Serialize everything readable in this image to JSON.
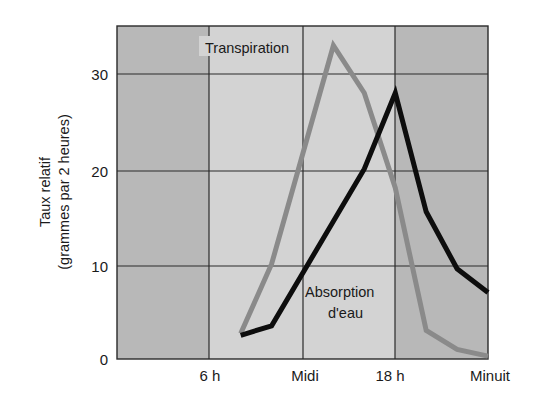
{
  "chart_data": {
    "type": "line",
    "title": "",
    "xlabel": "",
    "ylabel": [
      "Taux relatif",
      "(grammes par 2 heures)"
    ],
    "x_ticks": [
      {
        "label": "6 h",
        "hour": 6
      },
      {
        "label": "Midi",
        "hour": 12
      },
      {
        "label": "18 h",
        "hour": 18
      },
      {
        "label": "Minuit",
        "hour": 24
      }
    ],
    "y_ticks": [
      0,
      10,
      20,
      30
    ],
    "xlim": [
      0,
      24
    ],
    "ylim": [
      0,
      35
    ],
    "grid": true,
    "series": [
      {
        "name": "Transpiration",
        "color": "#8a8a8a",
        "x": [
          8,
          10,
          14,
          16,
          18,
          20,
          22,
          24
        ],
        "values": [
          2.7,
          10,
          33,
          28,
          18,
          3,
          1,
          0.3
        ]
      },
      {
        "name": "Absorption d'eau",
        "color": "#0d0d0d",
        "x": [
          8,
          10,
          16,
          18,
          20,
          22,
          24
        ],
        "values": [
          2.5,
          3.5,
          20,
          28,
          15.5,
          9.5,
          7
        ]
      }
    ],
    "annotations": [
      {
        "text": "Transpiration",
        "near": "transpiration-peak"
      },
      {
        "text": "Absorption d'eau",
        "near": "absorption-mid"
      }
    ],
    "background_bands": [
      {
        "from": 0,
        "to": 6,
        "shade": "dark"
      },
      {
        "from": 6,
        "to": 18,
        "shade": "light"
      },
      {
        "from": 18,
        "to": 24,
        "shade": "dark"
      }
    ]
  },
  "labels": {
    "ylabel_line1": "Taux relatif",
    "ylabel_line2": "(grammes par 2 heures)",
    "transpiration": "Transpiration",
    "absorption_line1": "Absorption",
    "absorption_line2": "d'eau",
    "x6": "6 h",
    "x12": "Midi",
    "x18": "18 h",
    "x24": "Minuit",
    "y0": "0",
    "y10": "10",
    "y20": "20",
    "y30": "30"
  }
}
